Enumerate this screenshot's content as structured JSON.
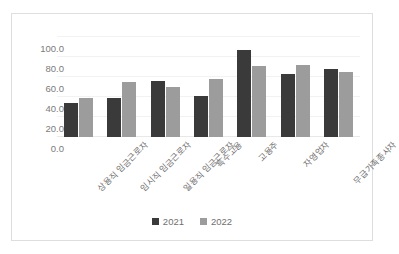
{
  "chart_data": {
    "type": "bar",
    "title": "",
    "subtitle": "",
    "xlabel": "",
    "ylabel": "",
    "ylim": [
      0.0,
      100.0
    ],
    "ytick_step": 20.0,
    "ytick_labels": [
      "100.0",
      "80.0",
      "60.0",
      "40.0",
      "20.0",
      "0.0"
    ],
    "ytick_values": [
      100.0,
      80.0,
      60.0,
      40.0,
      20.0,
      0.0
    ],
    "grid": true,
    "legend_position": "bottom-center",
    "categories": [
      "상용직 임금근로자",
      "임시직 임금근로자",
      "일용직 임금근로자",
      "특수고용",
      "고용주",
      "자영업자",
      "무급가족종사자"
    ],
    "series": [
      {
        "name": "2021",
        "color": "#3a3a3a",
        "values": [
          34,
          39,
          55,
          41,
          86,
          62,
          67
        ]
      },
      {
        "name": "2022",
        "color": "#9c9c9c",
        "values": [
          39,
          54,
          50,
          57,
          70,
          71,
          64
        ]
      }
    ]
  },
  "legend": {
    "items": [
      {
        "label": "2021",
        "color": "#3a3a3a"
      },
      {
        "label": "2022",
        "color": "#9c9c9c"
      }
    ]
  },
  "colors": {
    "frame": "#dedede",
    "gridline": "#f2f2f2",
    "axis_text": "#7b7b7b",
    "label_text": "#6f6f6f",
    "background": "#ffffff"
  }
}
